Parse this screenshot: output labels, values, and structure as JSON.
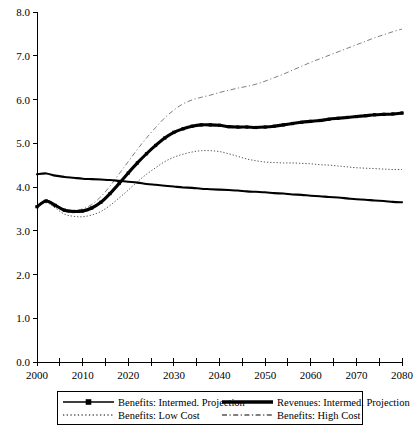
{
  "chart_data": {
    "type": "line",
    "title": "",
    "subtitle": "",
    "xlabel": "",
    "ylabel": "",
    "xlim": [
      2000,
      2080
    ],
    "ylim": [
      0.0,
      8.0
    ],
    "grid": false,
    "legend_position": "bottom",
    "x_ticks_major": [
      2000,
      2010,
      2020,
      2030,
      2040,
      2050,
      2060,
      2070,
      2080
    ],
    "x_ticks_minor": [
      2005,
      2015,
      2025,
      2035,
      2045,
      2055,
      2065,
      2075
    ],
    "x_tick_labels": [
      "2000",
      "2010",
      "2020",
      "2030",
      "2040",
      "2050",
      "2060",
      "2070",
      "2080"
    ],
    "y_ticks": [
      0.0,
      1.0,
      2.0,
      3.0,
      4.0,
      5.0,
      6.0,
      7.0,
      8.0
    ],
    "y_tick_labels": [
      "0.0",
      "1.0",
      "2.0",
      "3.0",
      "4.0",
      "5.0",
      "6.0",
      "7.0",
      "8.0"
    ],
    "x": [
      2000,
      2002,
      2004,
      2006,
      2008,
      2010,
      2012,
      2014,
      2016,
      2018,
      2020,
      2022,
      2024,
      2026,
      2028,
      2030,
      2032,
      2034,
      2036,
      2038,
      2040,
      2042,
      2044,
      2046,
      2048,
      2050,
      2052,
      2054,
      2056,
      2058,
      2060,
      2062,
      2064,
      2066,
      2068,
      2070,
      2072,
      2074,
      2076,
      2078,
      2080
    ],
    "series": [
      {
        "name": "Benefits: Intermed. Projection",
        "style": "solid-thick-marker",
        "color": "#000000",
        "values": [
          3.55,
          3.68,
          3.58,
          3.47,
          3.44,
          3.45,
          3.52,
          3.65,
          3.85,
          4.08,
          4.32,
          4.55,
          4.76,
          4.95,
          5.12,
          5.25,
          5.33,
          5.39,
          5.42,
          5.42,
          5.41,
          5.38,
          5.37,
          5.37,
          5.36,
          5.37,
          5.39,
          5.42,
          5.45,
          5.48,
          5.5,
          5.52,
          5.55,
          5.57,
          5.59,
          5.61,
          5.63,
          5.65,
          5.66,
          5.67,
          5.69
        ]
      },
      {
        "name": "Revenues: Intermed. Projection",
        "style": "solid-thick",
        "color": "#000000",
        "values": [
          4.29,
          4.31,
          4.26,
          4.23,
          4.21,
          4.19,
          4.18,
          4.17,
          4.16,
          4.14,
          4.12,
          4.1,
          4.07,
          4.05,
          4.03,
          4.01,
          3.99,
          3.98,
          3.96,
          3.95,
          3.94,
          3.93,
          3.92,
          3.9,
          3.89,
          3.88,
          3.86,
          3.85,
          3.83,
          3.82,
          3.8,
          3.79,
          3.77,
          3.76,
          3.74,
          3.72,
          3.71,
          3.69,
          3.68,
          3.66,
          3.65
        ]
      },
      {
        "name": "Benefits: Low Cost",
        "style": "dotted",
        "color": "#555555",
        "values": [
          3.54,
          3.64,
          3.52,
          3.38,
          3.33,
          3.32,
          3.36,
          3.44,
          3.58,
          3.75,
          3.93,
          4.12,
          4.29,
          4.44,
          4.58,
          4.68,
          4.75,
          4.8,
          4.83,
          4.83,
          4.81,
          4.76,
          4.7,
          4.64,
          4.6,
          4.57,
          4.56,
          4.55,
          4.55,
          4.54,
          4.53,
          4.51,
          4.5,
          4.48,
          4.46,
          4.44,
          4.43,
          4.42,
          4.41,
          4.4,
          4.4
        ]
      },
      {
        "name": "Benefits: High Cost",
        "style": "dash-dot",
        "color": "#777777",
        "values": [
          3.56,
          3.7,
          3.6,
          3.5,
          3.47,
          3.5,
          3.6,
          3.78,
          4.02,
          4.3,
          4.58,
          4.86,
          5.12,
          5.36,
          5.58,
          5.76,
          5.9,
          5.99,
          6.05,
          6.1,
          6.16,
          6.21,
          6.26,
          6.3,
          6.35,
          6.42,
          6.5,
          6.58,
          6.67,
          6.76,
          6.85,
          6.93,
          7.01,
          7.09,
          7.17,
          7.25,
          7.33,
          7.41,
          7.48,
          7.55,
          7.61
        ]
      }
    ],
    "legend": [
      {
        "label": "Benefits: Intermed. Projection",
        "style": "solid-thick-marker"
      },
      {
        "label": "Revenues: Intermed. Projection",
        "style": "solid-thick"
      },
      {
        "label": "Benefits: Low Cost",
        "style": "dotted"
      },
      {
        "label": "Benefits: High Cost",
        "style": "dash-dot"
      }
    ]
  }
}
